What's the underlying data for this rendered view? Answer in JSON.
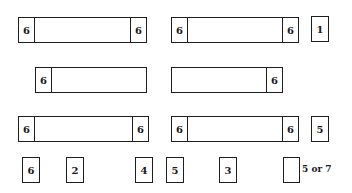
{
  "diagram": {
    "rows": [
      {
        "bars": [
          {
            "left_cell": "6",
            "right_cell": "6"
          },
          {
            "left_cell": "6",
            "right_cell": "6"
          }
        ],
        "side_box": "1"
      },
      {
        "bars": [
          {
            "left_cell": "6",
            "right_cell": null
          },
          {
            "left_cell": null,
            "right_cell": "6"
          }
        ]
      },
      {
        "bars": [
          {
            "left_cell": "6",
            "right_cell": "6"
          },
          {
            "left_cell": "6",
            "right_cell": "6"
          }
        ],
        "side_box": "5"
      }
    ],
    "bottom_boxes": [
      "6",
      "2",
      "4",
      "5",
      "3",
      ""
    ],
    "bottom_note": "5 or 7"
  }
}
